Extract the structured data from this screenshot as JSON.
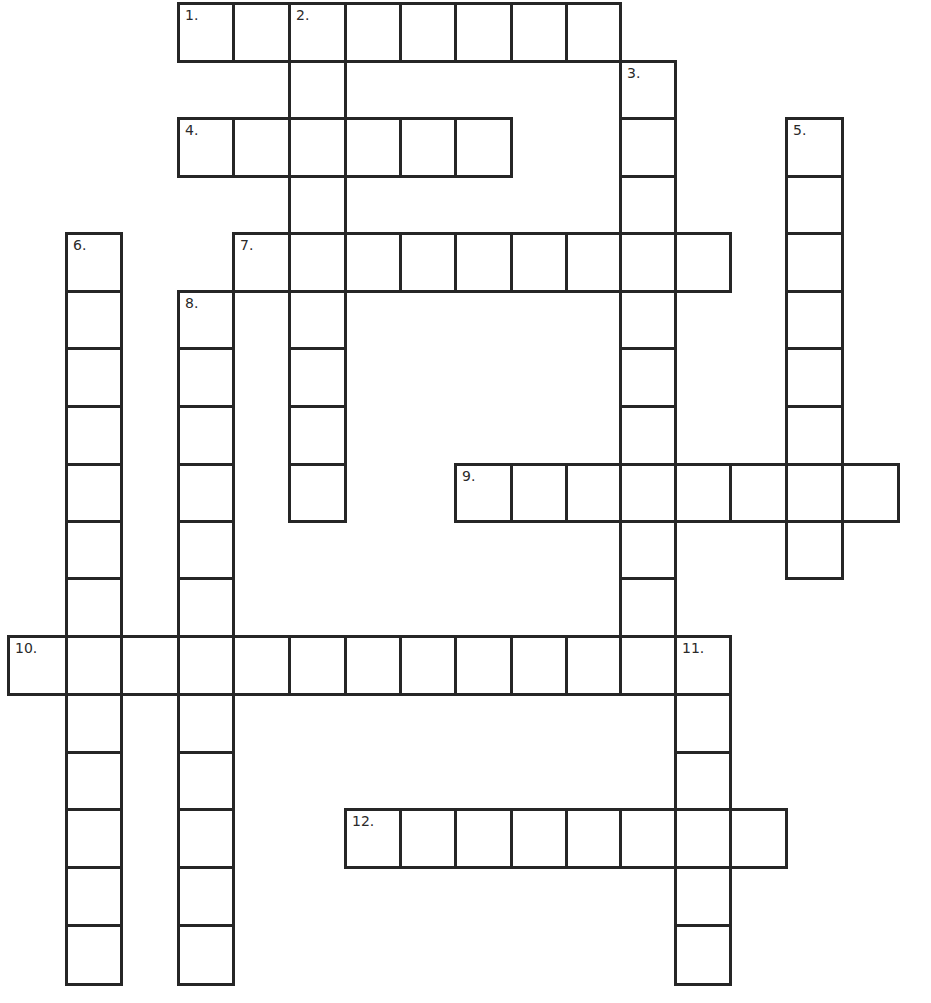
{
  "puzzle": {
    "type": "crossword",
    "line_color": "#262626",
    "background": "#ffffff",
    "col_x": [
      8,
      66,
      121,
      178,
      233,
      289,
      345,
      400,
      455,
      511,
      566,
      620,
      675,
      730,
      786,
      842,
      898
    ],
    "row_y": [
      3,
      61,
      118,
      176,
      233,
      291,
      348,
      406,
      464,
      521,
      578,
      636,
      694,
      752,
      809,
      867,
      925,
      984
    ],
    "entries": [
      {
        "number": "1.",
        "direction": "across",
        "row": 0,
        "col": 3,
        "length": 8
      },
      {
        "number": "2.",
        "direction": "down",
        "row": 0,
        "col": 5,
        "length": 9
      },
      {
        "number": "3.",
        "direction": "down",
        "row": 1,
        "col": 11,
        "length": 11
      },
      {
        "number": "4.",
        "direction": "across",
        "row": 2,
        "col": 3,
        "length": 6
      },
      {
        "number": "5.",
        "direction": "down",
        "row": 2,
        "col": 14,
        "length": 8
      },
      {
        "number": "6.",
        "direction": "down",
        "row": 4,
        "col": 1,
        "length": 13
      },
      {
        "number": "7.",
        "direction": "across",
        "row": 4,
        "col": 4,
        "length": 9
      },
      {
        "number": "8.",
        "direction": "down",
        "row": 5,
        "col": 3,
        "length": 12
      },
      {
        "number": "9.",
        "direction": "across",
        "row": 8,
        "col": 8,
        "length": 8
      },
      {
        "number": "10.",
        "direction": "across",
        "row": 11,
        "col": 0,
        "length": 13
      },
      {
        "number": "11.",
        "direction": "down",
        "row": 11,
        "col": 12,
        "length": 6
      },
      {
        "number": "12.",
        "direction": "across",
        "row": 14,
        "col": 6,
        "length": 8
      }
    ],
    "cell_values": {}
  }
}
